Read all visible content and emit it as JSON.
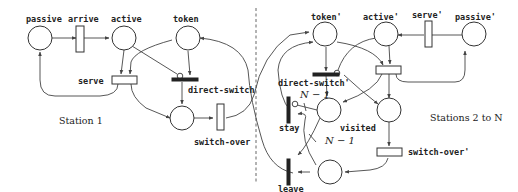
{
  "diagram": {
    "type": "petri-net",
    "station1": {
      "title": "Station 1",
      "places": {
        "passive": "passive",
        "active": "active",
        "token": "token"
      },
      "transitions": {
        "arrive": "arrive",
        "serve": "serve",
        "direct_switch": "direct-switch",
        "switch_over": "switch-over"
      }
    },
    "station2": {
      "title": "Stations 2 to N",
      "places": {
        "token": "token'",
        "active": "active'",
        "passive": "passive'",
        "visited": "visited"
      },
      "transitions": {
        "serve": "serve'",
        "direct_switch": "direct-switch'",
        "switch_over": "switch-over'",
        "stay": "stay",
        "leave": "leave"
      },
      "arc_weights": {
        "stay_inhibitor": "N − 1",
        "leave_input": "N − 1"
      }
    }
  }
}
